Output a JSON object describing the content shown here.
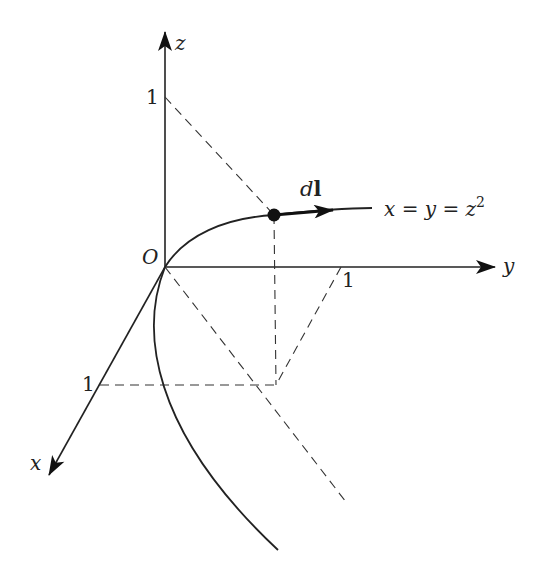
{
  "figure": {
    "axes": {
      "z": {
        "label": "z",
        "tick_label": "1"
      },
      "y": {
        "label": "y",
        "tick_label": "1"
      },
      "x": {
        "label": "x",
        "tick_label": "1"
      },
      "origin_label": "O"
    },
    "curve": {
      "equation_lhs": "x = y = z",
      "equation_exp": "2"
    },
    "element": {
      "label_d": "d",
      "label_l": "l"
    }
  }
}
